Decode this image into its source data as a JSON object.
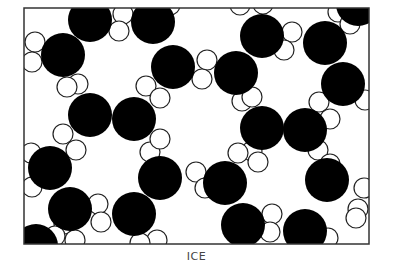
{
  "caption": "ICE",
  "colors": {
    "oxygen": "#000000",
    "hydrogen_fill": "#ffffff",
    "hydrogen_stroke": "#222222",
    "frame": "#333333"
  },
  "frame": {
    "x": 24,
    "y": 8,
    "w": 345,
    "h": 236
  },
  "oxygen_radius": 22,
  "hydrogen_radius": 10,
  "oxygen_atoms": [
    [
      90,
      20
    ],
    [
      153,
      22
    ],
    [
      63,
      55
    ],
    [
      173,
      67
    ],
    [
      236,
      73
    ],
    [
      262,
      36
    ],
    [
      325,
      43
    ],
    [
      343,
      84
    ],
    [
      90,
      115
    ],
    [
      134,
      119
    ],
    [
      262,
      128
    ],
    [
      305,
      130
    ],
    [
      50,
      168
    ],
    [
      160,
      178
    ],
    [
      225,
      183
    ],
    [
      327,
      180
    ],
    [
      70,
      209
    ],
    [
      134,
      214
    ],
    [
      243,
      225
    ],
    [
      305,
      231
    ],
    [
      36,
      246
    ],
    [
      358,
      4
    ]
  ],
  "hydrogen_atoms": [
    [
      123,
      14
    ],
    [
      119,
      31
    ],
    [
      35,
      42
    ],
    [
      32,
      62
    ],
    [
      78,
      84
    ],
    [
      67,
      87
    ],
    [
      146,
      86
    ],
    [
      160,
      98
    ],
    [
      207,
      60
    ],
    [
      202,
      79
    ],
    [
      242,
      101
    ],
    [
      252,
      97
    ],
    [
      240,
      5
    ],
    [
      263,
      4
    ],
    [
      292,
      32
    ],
    [
      284,
      50
    ],
    [
      338,
      12
    ],
    [
      350,
      24
    ],
    [
      319,
      102
    ],
    [
      330,
      119
    ],
    [
      365,
      100
    ],
    [
      63,
      134
    ],
    [
      76,
      150
    ],
    [
      150,
      152
    ],
    [
      160,
      139
    ],
    [
      252,
      151
    ],
    [
      238,
      153
    ],
    [
      318,
      150
    ],
    [
      330,
      164
    ],
    [
      31,
      153
    ],
    [
      32,
      187
    ],
    [
      196,
      172
    ],
    [
      205,
      188
    ],
    [
      258,
      162
    ],
    [
      364,
      188
    ],
    [
      358,
      209
    ],
    [
      64,
      224
    ],
    [
      75,
      240
    ],
    [
      98,
      204
    ],
    [
      101,
      222
    ],
    [
      272,
      214
    ],
    [
      270,
      232
    ],
    [
      157,
      240
    ],
    [
      140,
      243
    ],
    [
      328,
      238
    ],
    [
      356,
      218
    ],
    [
      170,
      5
    ],
    [
      55,
      236
    ]
  ]
}
